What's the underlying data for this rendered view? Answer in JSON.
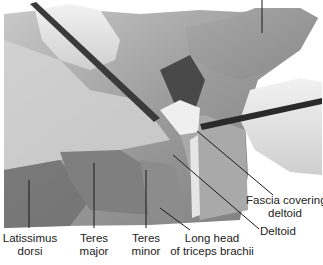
{
  "figure": {
    "labels": {
      "latissimus_dorsi": [
        "Latissimus",
        "dorsi"
      ],
      "teres_major": [
        "Teres",
        "major"
      ],
      "teres_minor": [
        "Teres",
        "minor"
      ],
      "long_head_triceps": [
        "Long head",
        "of triceps brachii"
      ],
      "deltoid": "Deltoid",
      "fascia_covering_deltoid": [
        "Fascia covering",
        "deltoid"
      ]
    },
    "colors": {
      "background": "#ffffff",
      "label_text": "#222222",
      "leader_line": "#1a1a1a"
    }
  }
}
